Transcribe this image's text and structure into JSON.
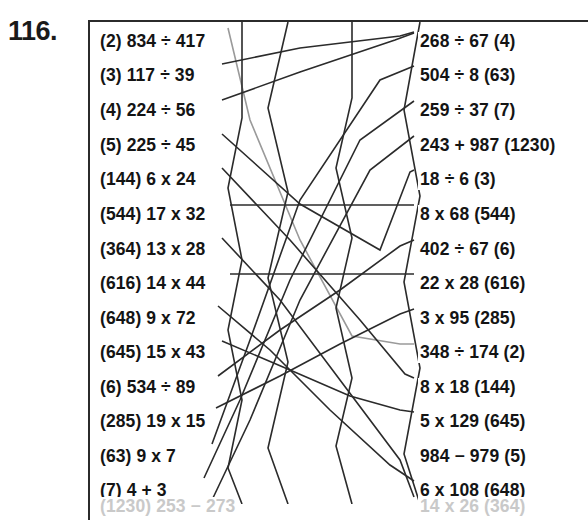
{
  "exercise": {
    "number_label": "116.",
    "title": "Matching exercise — join each expression on the left to its equal expression on the right"
  },
  "panel": {
    "border_color": "#2b2b2b",
    "background": "#ffffff",
    "text_color": "#141414"
  },
  "left_column": {
    "items": [
      {
        "text": "(2) 834 ÷ 417",
        "y": 32,
        "clipped": false
      },
      {
        "text": "(3) 117 ÷ 39",
        "y": 66,
        "clipped": false
      },
      {
        "text": "(4) 224 ÷ 56",
        "y": 101,
        "clipped": false
      },
      {
        "text": "(5) 225 ÷ 45",
        "y": 136,
        "clipped": false
      },
      {
        "text": "(144) 6 x 24",
        "y": 170,
        "clipped": false
      },
      {
        "text": "(544) 17 x 32",
        "y": 205,
        "clipped": false
      },
      {
        "text": "(364) 13 x 28",
        "y": 240,
        "clipped": false
      },
      {
        "text": "(616) 14 x 44",
        "y": 274,
        "clipped": false
      },
      {
        "text": "(648) 9 x 72",
        "y": 309,
        "clipped": false
      },
      {
        "text": "(645) 15 x 43",
        "y": 343,
        "clipped": false
      },
      {
        "text": "(6) 534 ÷ 89",
        "y": 378,
        "clipped": false
      },
      {
        "text": "(285) 19 x 15",
        "y": 412,
        "clipped": false
      },
      {
        "text": "(63) 9 x 7",
        "y": 447,
        "clipped": false
      },
      {
        "text": "(7) 4 + 3",
        "y": 481,
        "clipped": false
      },
      {
        "text": "(1230) 253 − 273",
        "y": 497,
        "clipped": true
      }
    ]
  },
  "right_column": {
    "items": [
      {
        "text": "268 ÷ 67 (4)",
        "y": 32,
        "clipped": false
      },
      {
        "text": "504 ÷ 8 (63)",
        "y": 66,
        "clipped": false
      },
      {
        "text": "259 ÷ 37 (7)",
        "y": 101,
        "clipped": false
      },
      {
        "text": "243 + 987 (1230)",
        "y": 136,
        "clipped": false
      },
      {
        "text": "18 ÷ 6 (3)",
        "y": 170,
        "clipped": false
      },
      {
        "text": "8 x 68 (544)",
        "y": 205,
        "clipped": false
      },
      {
        "text": "402 ÷ 67 (6)",
        "y": 240,
        "clipped": false
      },
      {
        "text": "22 x 28 (616)",
        "y": 274,
        "clipped": false
      },
      {
        "text": "3 x 95 (285)",
        "y": 309,
        "clipped": false
      },
      {
        "text": "348 ÷ 174 (2)",
        "y": 343,
        "clipped": false
      },
      {
        "text": "8 x 18 (144)",
        "y": 378,
        "clipped": false
      },
      {
        "text": "5 x 129 (645)",
        "y": 412,
        "clipped": false
      },
      {
        "text": "984 − 979 (5)",
        "y": 447,
        "clipped": false
      },
      {
        "text": "6 x 108 (648)",
        "y": 481,
        "clipped": false
      },
      {
        "text": "14 x 26 (364)",
        "y": 497,
        "clipped": true
      }
    ]
  },
  "connectors": {
    "stroke_color": "#2b2b2b",
    "stroke_color_faint": "#9a9a9a",
    "stroke_width": 1.6,
    "paths": [
      {
        "id": "c-834-348",
        "faint": true,
        "points": "228,28 250,120 300,240 352,336 400,344 414,344"
      },
      {
        "id": "c-117-268",
        "faint": false,
        "points": "222,64 300,48 400,36 414,32"
      },
      {
        "id": "c-224-268",
        "faint": false,
        "points": "222,100 300,72 395,40 414,33"
      },
      {
        "id": "c-225-18",
        "faint": false,
        "points": "222,134 300,204 380,250 410,172 414,170"
      },
      {
        "id": "c-144-8x18",
        "faint": false,
        "points": "222,168 290,240 360,320 405,374 414,378"
      },
      {
        "id": "c-544-8x68",
        "faint": false,
        "points": "230,205 320,205 400,205 414,205"
      },
      {
        "id": "c-364-14x26",
        "faint": false,
        "points": "222,238 280,300 340,380 400,460 414,497"
      },
      {
        "id": "c-616-22x28",
        "faint": false,
        "points": "230,274 320,274 400,274 414,274"
      },
      {
        "id": "c-648-6x108",
        "faint": false,
        "points": "218,306 270,350 330,410 390,465 414,481"
      },
      {
        "id": "c-645-5x129",
        "faint": false,
        "points": "222,341 290,370 350,396 400,410 414,412"
      },
      {
        "id": "c-534-402",
        "faint": false,
        "points": "218,376 280,330 340,290 400,246 414,240"
      },
      {
        "id": "c-285-3x95",
        "faint": false,
        "points": "216,408 280,376 340,344 400,314 414,309"
      },
      {
        "id": "c-63-504",
        "faint": false,
        "points": "212,444 250,340 300,200 380,80 414,66"
      },
      {
        "id": "c-7-259",
        "faint": false,
        "points": "204,478 240,400 290,280 360,140 414,101"
      },
      {
        "id": "c-1230-243",
        "faint": false,
        "points": "212,500 250,420 300,300 370,170 414,136"
      },
      {
        "id": "z-1",
        "faint": false,
        "points": "242,20 242,118 228,188 242,260 228,330 242,400 228,468 242,504"
      },
      {
        "id": "z-2",
        "faint": false,
        "points": "352,20 352,98 336,168 352,238 336,308 352,378 336,446 352,504"
      },
      {
        "id": "z-3",
        "faint": false,
        "points": "288,22 268,108 288,192 268,278 288,362 268,448 288,504"
      },
      {
        "id": "z-4",
        "faint": false,
        "points": "420,22 404,110 420,196 404,282 420,368 404,454 420,504"
      }
    ]
  }
}
